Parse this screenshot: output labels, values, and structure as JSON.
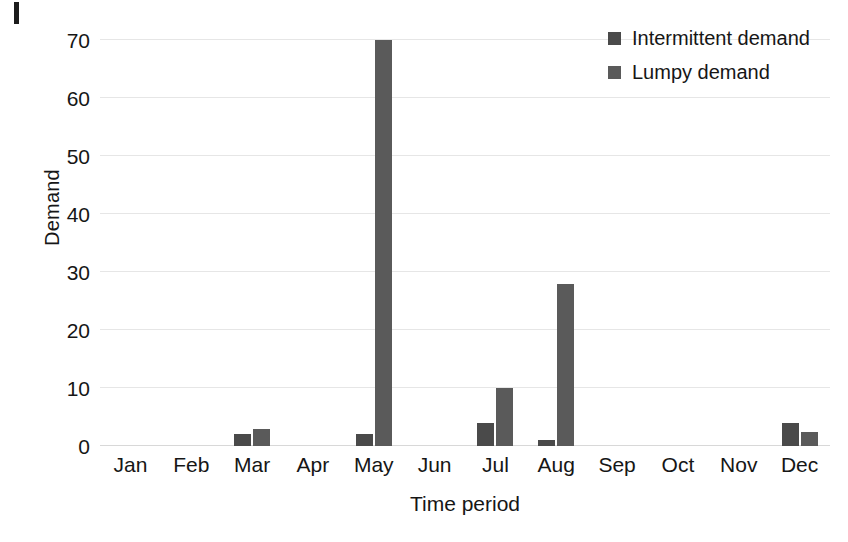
{
  "chart_data": {
    "type": "bar",
    "title": "",
    "xlabel": "Time period",
    "ylabel": "Demand",
    "categories": [
      "Jan",
      "Feb",
      "Mar",
      "Apr",
      "May",
      "Jun",
      "Jul",
      "Aug",
      "Sep",
      "Oct",
      "Nov",
      "Dec"
    ],
    "series": [
      {
        "name": "Intermittent demand",
        "color": "#4a4a4a",
        "values": [
          0,
          0,
          2,
          0,
          2,
          0,
          4,
          1,
          0,
          0,
          0,
          4
        ]
      },
      {
        "name": "Lumpy demand",
        "color": "#5a5a5a",
        "values": [
          0,
          0,
          3,
          0,
          70,
          0,
          10,
          28,
          0,
          0,
          0,
          2.5
        ]
      }
    ],
    "ylim": [
      0,
      70
    ],
    "yticks": [
      0,
      10,
      20,
      30,
      40,
      50,
      60,
      70
    ],
    "ytick_labels": [
      "0",
      "10",
      "20",
      "30",
      "40",
      "50",
      "60",
      "70"
    ],
    "grid": true,
    "grid_axis": "y",
    "legend_position": "top-right",
    "legend": [
      "Intermittent demand",
      "Lumpy demand"
    ]
  },
  "axes": {
    "y_title": "Demand",
    "x_title": "Time period"
  },
  "legend": {
    "items": [
      {
        "label": "Intermittent demand"
      },
      {
        "label": "Lumpy demand"
      }
    ]
  }
}
